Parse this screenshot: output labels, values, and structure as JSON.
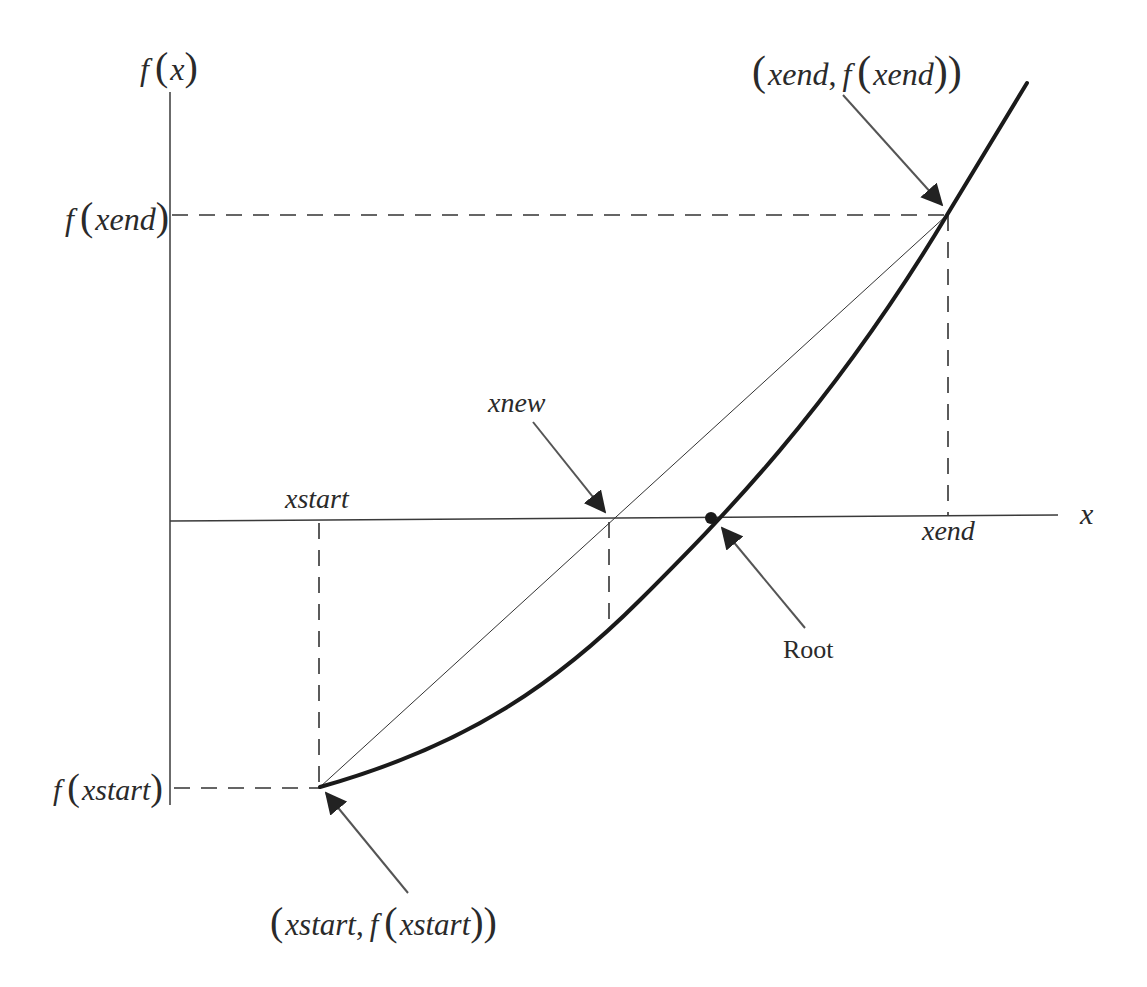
{
  "diagram": {
    "type": "false-position / secant root-finding illustration",
    "axes": {
      "y_label": "f(x)",
      "x_label": "x"
    },
    "axis_ticks": {
      "y_upper": "f(xend)",
      "y_lower": "f(xstart)",
      "x_left": "xstart",
      "x_right": "xend"
    },
    "annotations": {
      "top_point": "(xend, f(xend))",
      "bottom_point": "(xstart, f(xstart))",
      "secant_crossing": "xnew",
      "curve_crossing": "Root"
    },
    "parts": {
      "f": "f",
      "open": "(",
      "close": ")",
      "comma": ",",
      "xend": "xend",
      "xstart": "xstart",
      "x": "x"
    },
    "colors": {
      "curve": "#1a1a1a",
      "axis": "#3a3a3a",
      "dash": "#333333",
      "arrow": "#555555",
      "text": "#2a2a2a"
    },
    "geometry": {
      "origin_x": 170,
      "x_axis_y": 520,
      "xstart_px": 320,
      "xend_px": 947,
      "xnew_px": 610,
      "root_px": 711,
      "f_xend_py": 215,
      "f_xstart_py": 787
    }
  }
}
